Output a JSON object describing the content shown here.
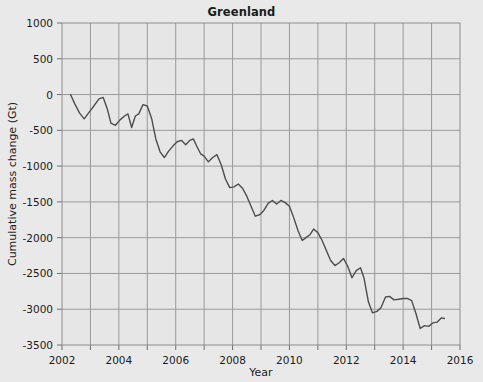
{
  "chart_data": {
    "type": "line",
    "title": "Greenland",
    "xlabel": "Year",
    "ylabel": "Cumulative mass change (Gt)",
    "xlim": [
      2002,
      2016
    ],
    "ylim": [
      -3500,
      1000
    ],
    "xticks": [
      2002,
      2004,
      2006,
      2008,
      2010,
      2012,
      2014,
      2016
    ],
    "xtick_labels": [
      "2002",
      "2004",
      "2006",
      "2008",
      "2010",
      "2012",
      "2014",
      "2016"
    ],
    "xminor_ticks": [
      2003,
      2005,
      2007,
      2009,
      2011,
      2013,
      2015
    ],
    "yticks": [
      1000,
      500,
      0,
      -500,
      -1000,
      -1500,
      -2000,
      -2500,
      -3000,
      -3500
    ],
    "ytick_labels": [
      "1000",
      "500",
      "0",
      "-500",
      "-1000",
      "-1500",
      "-2000",
      "-2500",
      "-3000",
      "-3500"
    ],
    "grid": true,
    "legend": null,
    "line_color": "#4d4d4d",
    "plot_bg_color": "#e6e6e6",
    "figure_bg_color": "#e9e9e9",
    "grid_color": "#9a9a9a",
    "series": [
      {
        "name": "Greenland cumulative mass change",
        "x": [
          2002.3,
          2002.45,
          2002.62,
          2002.78,
          2002.95,
          2003.12,
          2003.3,
          2003.45,
          2003.6,
          2003.72,
          2003.88,
          2004.05,
          2004.2,
          2004.32,
          2004.45,
          2004.58,
          2004.7,
          2004.85,
          2005.0,
          2005.15,
          2005.3,
          2005.45,
          2005.6,
          2005.75,
          2005.9,
          2006.05,
          2006.2,
          2006.35,
          2006.5,
          2006.62,
          2006.75,
          2006.88,
          2007.0,
          2007.15,
          2007.3,
          2007.45,
          2007.6,
          2007.75,
          2007.9,
          2008.05,
          2008.2,
          2008.35,
          2008.5,
          2008.65,
          2008.8,
          2008.95,
          2009.1,
          2009.25,
          2009.4,
          2009.55,
          2009.7,
          2009.85,
          2010.0,
          2010.15,
          2010.3,
          2010.45,
          2010.58,
          2010.72,
          2010.85,
          2011.0,
          2011.15,
          2011.3,
          2011.45,
          2011.6,
          2011.75,
          2011.9,
          2012.05,
          2012.2,
          2012.35,
          2012.5,
          2012.62,
          2012.78,
          2012.92,
          2013.08,
          2013.22,
          2013.38,
          2013.52,
          2013.68,
          2013.85,
          2014.0,
          2014.15,
          2014.3,
          2014.45,
          2014.6,
          2014.75,
          2014.9,
          2015.05,
          2015.2,
          2015.35,
          2015.45
        ],
        "y": [
          0,
          -130,
          -260,
          -340,
          -250,
          -160,
          -60,
          -40,
          -210,
          -400,
          -430,
          -350,
          -300,
          -270,
          -460,
          -300,
          -270,
          -140,
          -160,
          -330,
          -620,
          -800,
          -880,
          -790,
          -720,
          -660,
          -640,
          -700,
          -640,
          -620,
          -730,
          -830,
          -860,
          -940,
          -880,
          -840,
          -980,
          -1180,
          -1300,
          -1290,
          -1250,
          -1310,
          -1420,
          -1560,
          -1700,
          -1680,
          -1620,
          -1520,
          -1480,
          -1530,
          -1480,
          -1510,
          -1560,
          -1720,
          -1900,
          -2040,
          -2000,
          -1960,
          -1880,
          -1930,
          -2040,
          -2180,
          -2320,
          -2390,
          -2350,
          -2290,
          -2400,
          -2560,
          -2460,
          -2420,
          -2560,
          -2900,
          -3050,
          -3030,
          -2980,
          -2830,
          -2820,
          -2870,
          -2860,
          -2850,
          -2850,
          -2880,
          -3060,
          -3270,
          -3230,
          -3240,
          -3190,
          -3180,
          -3120,
          -3130
        ]
      }
    ]
  }
}
